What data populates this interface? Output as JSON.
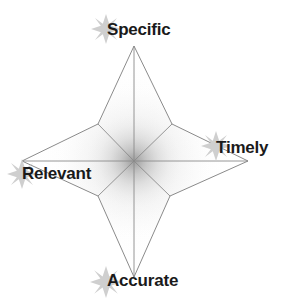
{
  "diagram": {
    "type": "four-point-star",
    "background_color": "#ffffff",
    "outline_color": "#808080",
    "shade_color": "#9a9a9a",
    "label_color": "#1a1a1a",
    "sparkle_color": "#cccccc",
    "center": {
      "x": 134,
      "y": 161
    },
    "points": [
      {
        "id": "specific",
        "label": "Specific",
        "direction": "top",
        "tip": {
          "x": 134,
          "y": 46
        },
        "sparkle": "sparkle-icon"
      },
      {
        "id": "timely",
        "label": "Timely",
        "direction": "right",
        "tip": {
          "x": 248,
          "y": 161
        },
        "sparkle": "sparkle-icon"
      },
      {
        "id": "accurate",
        "label": "Accurate",
        "direction": "bottom",
        "tip": {
          "x": 134,
          "y": 277
        },
        "sparkle": "sparkle-icon"
      },
      {
        "id": "relevant",
        "label": "Relevant",
        "direction": "left",
        "tip": {
          "x": 22,
          "y": 161
        },
        "sparkle": "sparkle-icon"
      }
    ],
    "inner_vertices": [
      {
        "x": 172,
        "y": 124
      },
      {
        "x": 170,
        "y": 196
      },
      {
        "x": 98,
        "y": 196
      },
      {
        "x": 98,
        "y": 124
      }
    ]
  }
}
